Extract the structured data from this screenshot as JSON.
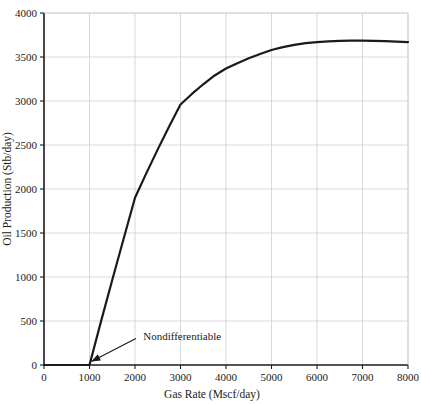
{
  "chart_data": {
    "type": "line",
    "title": "",
    "xlabel": "Gas Rate (Mscf/day)",
    "ylabel": "Oil Production (Stb/day)",
    "xlim": [
      0,
      8000
    ],
    "ylim": [
      0,
      4000
    ],
    "grid": true,
    "legend": "none",
    "xticks": [
      0,
      1000,
      2000,
      3000,
      4000,
      5000,
      6000,
      7000,
      8000
    ],
    "xtick_labels": [
      "0",
      "1000",
      "2000",
      "3000",
      "4000",
      "5000",
      "6000",
      "7000",
      "8000"
    ],
    "yticks": [
      0,
      500,
      1000,
      1500,
      2000,
      2500,
      3000,
      3500,
      4000
    ],
    "ytick_labels": [
      "0",
      "500",
      "1000",
      "1500",
      "2000",
      "2500",
      "3000",
      "3500",
      "4000"
    ],
    "series": [
      {
        "name": "Oil Production",
        "color": "#1a1a1a",
        "line_width": 2.2,
        "x": [
          0,
          250,
          500,
          750,
          1000,
          1250,
          1500,
          1750,
          2000,
          2250,
          2500,
          2750,
          3000,
          3250,
          3500,
          3750,
          4000,
          4250,
          4500,
          4750,
          5000,
          5250,
          5500,
          5750,
          6000,
          6250,
          6500,
          6750,
          7000,
          7250,
          7500,
          7750,
          8000
        ],
        "y": [
          0,
          0,
          0,
          0,
          0,
          490,
          965,
          1435,
          1900,
          2180,
          2450,
          2710,
          2960,
          3080,
          3190,
          3290,
          3370,
          3430,
          3485,
          3535,
          3580,
          3612,
          3638,
          3657,
          3670,
          3678,
          3683,
          3686,
          3687,
          3684,
          3680,
          3675,
          3670
        ]
      }
    ],
    "annotations": [
      {
        "text": "Nondifferentiable",
        "text_x": 2180,
        "text_y": 330,
        "arrow_from_x": 2020,
        "arrow_from_y": 300,
        "arrow_to_x": 1040,
        "arrow_to_y": 40
      }
    ],
    "colors": {
      "grid": "#cfcfcf",
      "axis": "#1a1a1a",
      "curve": "#1a1a1a",
      "background": "#ffffff",
      "text": "#1a1a1a"
    }
  }
}
